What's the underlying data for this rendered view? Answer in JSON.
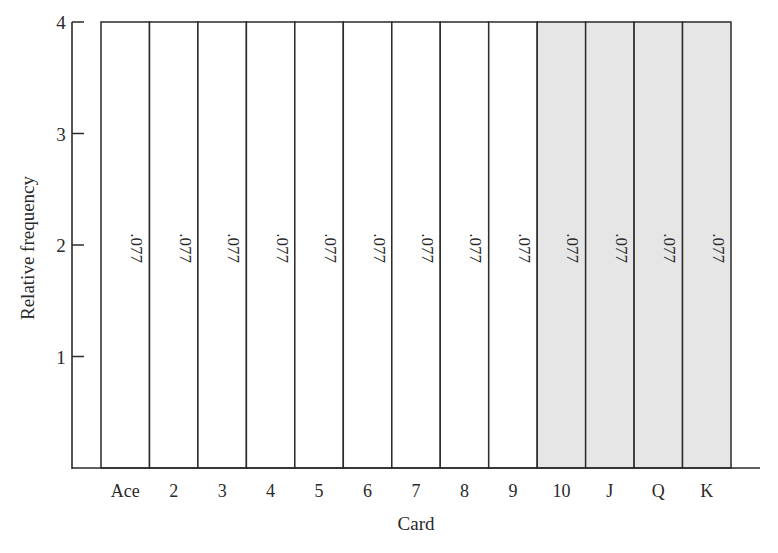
{
  "chart_data": {
    "type": "bar",
    "title": "",
    "xlabel": "Card",
    "ylabel": "Relative frequency",
    "categories": [
      "Ace",
      "2",
      "3",
      "4",
      "5",
      "6",
      "7",
      "8",
      "9",
      "10",
      "J",
      "Q",
      "K"
    ],
    "values": [
      4,
      4,
      4,
      4,
      4,
      4,
      4,
      4,
      4,
      4,
      4,
      4,
      4
    ],
    "bar_labels": [
      ".077",
      ".077",
      ".077",
      ".077",
      ".077",
      ".077",
      ".077",
      ".077",
      ".077",
      ".077",
      ".077",
      ".077",
      ".077"
    ],
    "shaded_categories": [
      "10",
      "J",
      "Q",
      "K"
    ],
    "ylim": [
      0,
      4
    ],
    "yticks": [
      1,
      2,
      3,
      4
    ],
    "grid": false,
    "legend": null,
    "colors": {
      "bar_fill": "#ffffff",
      "bar_fill_shaded": "#e6e6e6",
      "stroke": "#2a2a2a"
    }
  }
}
